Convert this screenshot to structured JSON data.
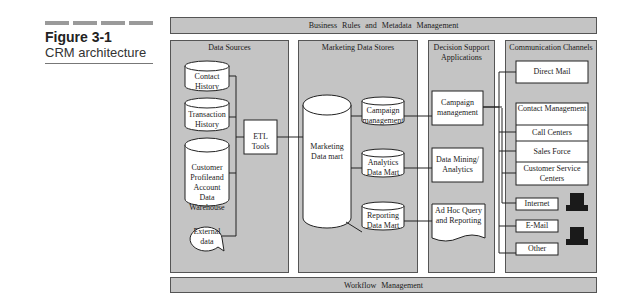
{
  "figure": {
    "number": "Figure 3-1",
    "caption": "CRM architecture"
  },
  "top_bar": "Business Rules and Metadata Management",
  "bottom_bar": "Workflow Management",
  "panels": {
    "data_sources": {
      "title": "Data Sources",
      "items": [
        "Contact History",
        "Transaction History",
        "Customer Profileand Account Data Warehouse",
        "External data"
      ],
      "etl": "ETL Tools"
    },
    "marketing": {
      "title": "Marketing Data Stores",
      "mart": "Marketing Data mart",
      "stores": [
        "Campaign management",
        "Analytics Data Mart",
        "Reporting Data Mart"
      ]
    },
    "decision": {
      "title": "Decision Support Applications",
      "apps": [
        "Campaign management",
        "Data Mining/ Analytics",
        "Ad Hoc Query and Reporting"
      ]
    },
    "channels": {
      "title": "Communication Channels",
      "direct_mail": "Direct Mail",
      "contact_mgmt": "Contact Management",
      "call_centers": "Call Centers",
      "sales_force": "Sales Force",
      "customer_service": "Customer Service Centers",
      "internet": "Internet",
      "email": "E-Mail",
      "other": "Other"
    }
  },
  "colors": {
    "panel_fill": "#c4c4c4",
    "box_fill": "#ffffff",
    "line": "#222222"
  }
}
